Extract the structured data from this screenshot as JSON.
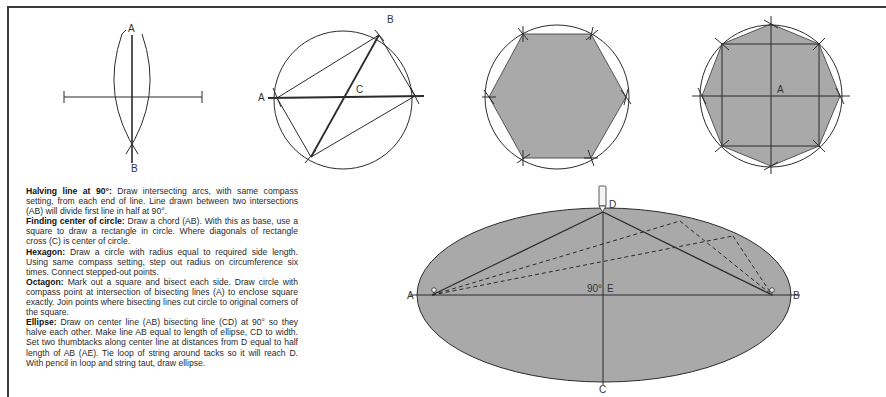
{
  "figures": {
    "halving_line": {
      "labels": {
        "a": "A",
        "b": "B"
      }
    },
    "circle_center": {
      "labels": {
        "a": "A",
        "b": "B",
        "c": "C"
      }
    },
    "hexagon": {},
    "octagon": {
      "labels": {
        "a": "A"
      }
    },
    "ellipse": {
      "labels": {
        "a": "A",
        "b": "B",
        "c": "C",
        "d": "D",
        "e": "E",
        "angle": "90°"
      },
      "fill": "#a9a9a9"
    }
  },
  "colors": {
    "shape_fill": "#a9a9a9",
    "line": "#2b2b2b"
  },
  "instructions": [
    {
      "title": "Halving line at 90°:",
      "body": " Draw intersecting arcs, with same compass setting, from each end of line. Line drawn between two intersections (AB) will divide first line in half at 90°."
    },
    {
      "title": "Finding center of circle:",
      "body": " Draw a chord (AB). With this as base, use a square to draw a rectangle in circle. Where diagonals of rectangle cross (C) is center of circle."
    },
    {
      "title": "Hexagon:",
      "body": " Draw a circle with radius equal to required side length. Using same compass setting, step out radius on circumference six times. Connect stepped-out points."
    },
    {
      "title": "Octagon:",
      "body": " Mark out a square and bisect each side. Draw circle with compass point at intersection of bisecting lines (A) to enclose square exactly. Join points where bisecting lines cut circle to original corners of the square."
    },
    {
      "title": "Ellipse:",
      "body": " Draw on center line (AB) bisecting line (CD) at 90° so they halve each other. Make line AB equal to length of ellipse, CD to width. Set two thumbtacks along center line at distances from D equal to half length of AB (AE). Tie loop of string around tacks so it will reach D. With pencil in loop and string taut, draw ellipse."
    }
  ]
}
